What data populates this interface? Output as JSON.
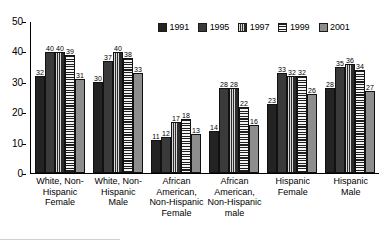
{
  "chart_data": {
    "type": "bar",
    "title": "",
    "subtitle": "",
    "xlabel": "",
    "ylabel": "",
    "ylim": [
      0,
      50
    ],
    "yticks": [
      0,
      10,
      20,
      30,
      40,
      50
    ],
    "grid": false,
    "legend_position": "top-right",
    "categories": [
      "White, Non-Hispanic Female",
      "White, Non-Hispanic Male",
      "African American, Non-Hispanic Female",
      "African American, Non-Hispanic male",
      "Hispanic Female",
      "Hispanic Male"
    ],
    "category_lines": [
      [
        "White, Non-",
        "Hispanic",
        "Female"
      ],
      [
        "White, Non-",
        "Hispanic",
        "Male"
      ],
      [
        "African",
        "American,",
        "Non-Hispanic",
        "Female"
      ],
      [
        "African",
        "American,",
        "Non-Hispanic",
        "male"
      ],
      [
        "Hispanic",
        "Female"
      ],
      [
        "Hispanic",
        "Male"
      ]
    ],
    "series": [
      {
        "name": "1991",
        "values": [
          32,
          30,
          11,
          14,
          23,
          28
        ]
      },
      {
        "name": "1995",
        "values": [
          40,
          37,
          12,
          28,
          33,
          35
        ]
      },
      {
        "name": "1997",
        "values": [
          40,
          40,
          17,
          28,
          32,
          36
        ]
      },
      {
        "name": "1999",
        "values": [
          39,
          38,
          18,
          22,
          32,
          34
        ]
      },
      {
        "name": "2001",
        "values": [
          31,
          33,
          13,
          16,
          26,
          27
        ]
      }
    ]
  },
  "legend": {
    "entries": [
      {
        "label": "1991",
        "swatch": "solid-dark",
        "color": "#232323"
      },
      {
        "label": "1995",
        "swatch": "solid-dark-gray",
        "color": "#3a3a3a"
      },
      {
        "label": "1997",
        "swatch": "vertical-hatch",
        "color": "#2f2f2f"
      },
      {
        "label": "1999",
        "swatch": "horizontal-hatch",
        "color": "#1e1e1e"
      },
      {
        "label": "2001",
        "swatch": "solid-gray",
        "color": "#8d8d8d"
      }
    ]
  },
  "axis": {
    "y_tick_labels": [
      "50",
      "40",
      "30",
      "20",
      "10",
      "0"
    ]
  }
}
